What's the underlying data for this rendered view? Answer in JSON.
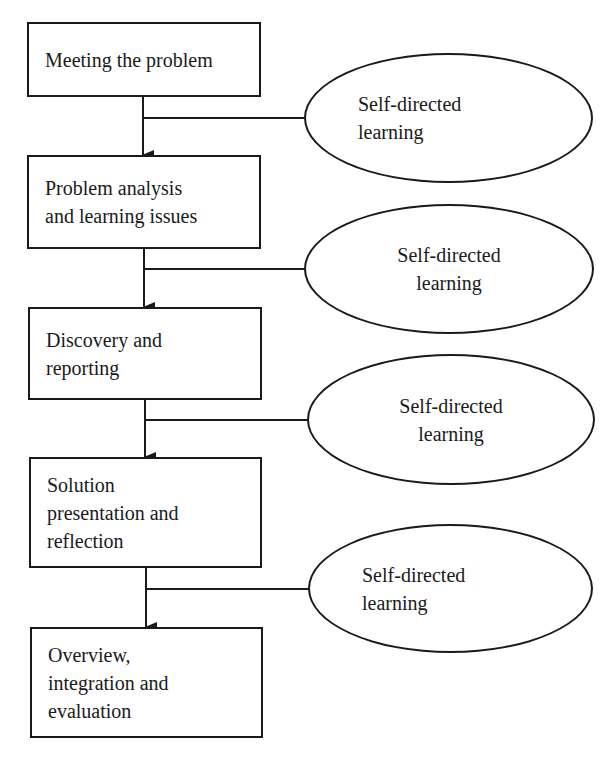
{
  "diagram": {
    "type": "flowchart",
    "steps": [
      {
        "label": "Meeting the problem"
      },
      {
        "label": "Problem analysis\nand learning issues"
      },
      {
        "label": "Discovery and\nreporting"
      },
      {
        "label": "Solution\npresentation and\nreflection"
      },
      {
        "label": "Overview,\nintegration and\nevaluation"
      }
    ],
    "side_nodes": [
      {
        "label": "Self-directed\nlearning"
      },
      {
        "label": "Self-directed\nlearning"
      },
      {
        "label": "Self-directed\nlearning"
      },
      {
        "label": "Self-directed\nlearning"
      }
    ],
    "colors": {
      "stroke": "#1a1a1a",
      "background": "#ffffff"
    }
  }
}
